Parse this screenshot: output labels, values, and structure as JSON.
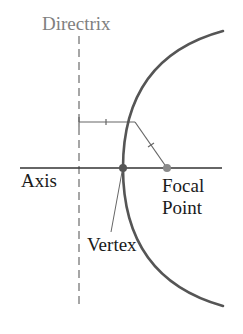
{
  "diagram": {
    "type": "parabola-anatomy",
    "labels": {
      "directrix": "Directrix",
      "axis": "Axis",
      "focal_point_line1": "Focal",
      "focal_point_line2": "Point",
      "vertex": "Vertex"
    },
    "colors": {
      "curve": "#555555",
      "axis": "#333333",
      "directrix_line": "#777777",
      "directrix_label": "#808080",
      "label_text": "#1a1a1a",
      "vertex_dot": "#555555",
      "focus_dot": "#8a8a8a",
      "construction_lines": "#666666"
    },
    "geometry": {
      "vertex": [
        123,
        168
      ],
      "focus": [
        167,
        168
      ],
      "directrix_x": 79,
      "focal_length_px": 44,
      "sample_point": [
        135,
        121
      ]
    }
  }
}
